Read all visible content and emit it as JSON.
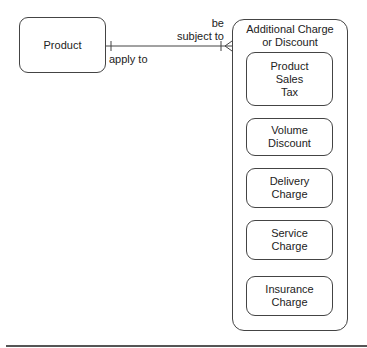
{
  "diagram": {
    "entities": {
      "product": {
        "label": "Product"
      },
      "additional": {
        "label": "Additional Charge\nor Discount",
        "subtypes": [
          {
            "label": "Product\nSales\nTax"
          },
          {
            "label": "Volume\nDiscount"
          },
          {
            "label": "Delivery\nCharge"
          },
          {
            "label": "Service\nCharge"
          },
          {
            "label": "Insurance\nCharge"
          }
        ]
      }
    },
    "relationship": {
      "from_label": "apply to",
      "to_label": "be\nsubject to",
      "from_cardinality": "one",
      "to_cardinality": "one-or-many"
    },
    "colors": {
      "stroke": "#444444",
      "background": "#ffffff"
    }
  }
}
